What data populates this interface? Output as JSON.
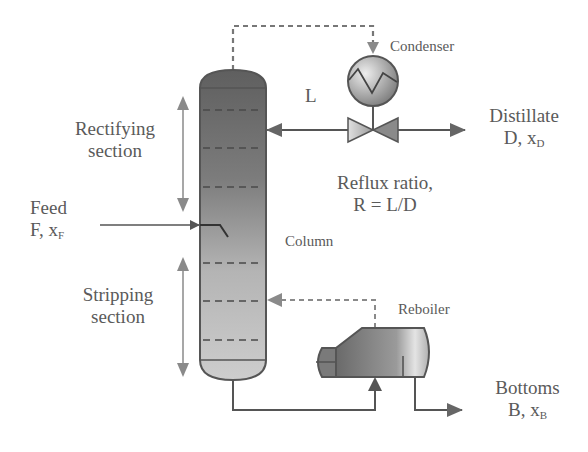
{
  "labels": {
    "condenser": "Condenser",
    "reflux_stream": "L",
    "distillate_line1": "Distillate",
    "distillate_line2_main": "D, x",
    "distillate_line2_sub": "D",
    "reflux_ratio_line1": "Reflux ratio,",
    "reflux_ratio_line2": "R = L/D",
    "rectifying_line1": "Rectifying",
    "rectifying_line2": "section",
    "feed_line1": "Feed",
    "feed_line2_main": "F, x",
    "feed_line2_sub": "F",
    "column": "Column",
    "stripping_line1": "Stripping",
    "stripping_line2": "section",
    "reboiler": "Reboiler",
    "bottoms_line1": "Bottoms",
    "bottoms_line2_main": "B, x",
    "bottoms_line2_sub": "B"
  },
  "components": [
    "Column",
    "Condenser",
    "Reflux valve",
    "Reboiler",
    "Feed inlet"
  ],
  "streams": [
    {
      "name": "Vapor overhead",
      "from": "Column",
      "to": "Condenser",
      "style": "dashed"
    },
    {
      "name": "Reflux L",
      "from": "Valve",
      "to": "Column",
      "style": "solid"
    },
    {
      "name": "Distillate D",
      "from": "Valve",
      "to": "out",
      "style": "solid"
    },
    {
      "name": "Feed F",
      "from": "in",
      "to": "Column",
      "style": "solid"
    },
    {
      "name": "Boil-up vapor",
      "from": "Reboiler",
      "to": "Column",
      "style": "dashed"
    },
    {
      "name": "Column bottoms",
      "from": "Column",
      "to": "Reboiler",
      "style": "solid"
    },
    {
      "name": "Bottoms B",
      "from": "Reboiler",
      "to": "out",
      "style": "solid"
    }
  ],
  "colors": {
    "line": "#555555",
    "light_arrow": "#8a8a8a",
    "column_top": "#5e5e5e",
    "column_bottom": "#cfcfcf",
    "text": "#5a5a5a"
  }
}
